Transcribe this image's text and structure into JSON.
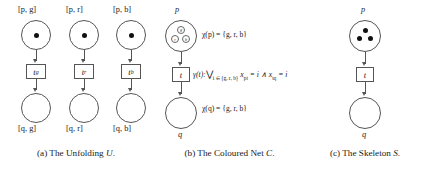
{
  "figure": {
    "panels": [
      {
        "id": "unfolding",
        "caption_prefix": "(a) The Unfolding ",
        "caption_symbol": "U",
        "caption_suffix": ".",
        "columns": [
          {
            "top_place_label": "[p, g]",
            "transition_label": "t",
            "transition_sub": "g",
            "bottom_place_label": "[q, g]",
            "token_count": 1
          },
          {
            "top_place_label": "[p, r]",
            "transition_label": "t",
            "transition_sub": "r",
            "bottom_place_label": "[q, r]",
            "token_count": 1
          },
          {
            "top_place_label": "[p, b]",
            "transition_label": "t",
            "transition_sub": "b",
            "bottom_place_label": "[q, b]",
            "token_count": 1
          }
        ]
      },
      {
        "id": "coloured-net",
        "caption_prefix": "(b) The Coloured Net ",
        "caption_symbol": "C",
        "caption_suffix": ".",
        "top_place_label": "p",
        "bottom_place_label": "q",
        "transition_label": "t",
        "tokens": [
          "g",
          "r",
          "b"
        ],
        "annotations": {
          "colour_p": "χ(p) = {g, r, b}",
          "colour_q": "χ(q) = {g, r, b}",
          "guard_head": "γ(t):",
          "guard_vee": "⋁",
          "guard_index": "i ∈ {g, r, b}",
          "guard_body_1": "x",
          "guard_body_1_sub": "pt",
          "guard_body_2": " = i ∧ x",
          "guard_body_2_sub": "tq",
          "guard_body_3": " = i"
        }
      },
      {
        "id": "skeleton",
        "caption_prefix": "(c) The Skeleton ",
        "caption_symbol": "S",
        "caption_suffix": ".",
        "top_place_label": "p",
        "bottom_place_label": "q",
        "transition_label": "t",
        "token_count": 3
      }
    ]
  },
  "colors": {
    "stroke": "#555555",
    "token": "#111111",
    "text": "#1a1a1a",
    "background": "#ffffff"
  }
}
